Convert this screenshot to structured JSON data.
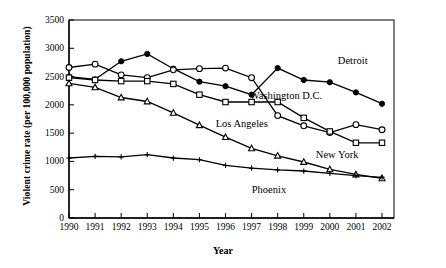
{
  "chart_data": {
    "type": "line",
    "title": "",
    "xlabel": "Year",
    "ylabel": "Violent crime rate (per 100,000 population)",
    "categories": [
      1990,
      1991,
      1992,
      1993,
      1994,
      1995,
      1996,
      1997,
      1998,
      1999,
      2000,
      2001,
      2002
    ],
    "x": [
      1990,
      1991,
      1992,
      1993,
      1994,
      1995,
      1996,
      1997,
      1998,
      1999,
      2000,
      2001,
      2002
    ],
    "xlim": [
      1990,
      2002
    ],
    "ylim": [
      0,
      3500
    ],
    "yticks": [
      0,
      500,
      1000,
      1500,
      2000,
      2500,
      3000,
      3500
    ],
    "ytick_labels": [
      "0",
      "500",
      "1000",
      "1500",
      "2000",
      "2500",
      "3000",
      "3500"
    ],
    "xtick_labels": [
      "1990",
      "1991",
      "1992",
      "1993",
      "1994",
      "1995",
      "1996",
      "1997",
      "1998",
      "1999",
      "2000",
      "2001",
      "2002"
    ],
    "grid": false,
    "legend_position": "inline-annotations",
    "series": [
      {
        "name": "Detroit",
        "marker": "filled-circle",
        "color": "#000000",
        "values": [
          2500,
          2450,
          2770,
          2900,
          2640,
          2410,
          2330,
          2180,
          2650,
          2440,
          2400,
          2220,
          2020
        ],
        "label_x": 2000,
        "label_y": 2770
      },
      {
        "name": "Washington D.C.",
        "marker": "open-circle",
        "color": "#000000",
        "values": [
          2660,
          2720,
          2530,
          2480,
          2620,
          2640,
          2650,
          2480,
          1810,
          1630,
          1510,
          1650,
          1560
        ],
        "label_x": 1999,
        "label_y": 2200
      },
      {
        "name": "Los Angeles",
        "marker": "open-square",
        "color": "#000000",
        "values": [
          2480,
          2440,
          2420,
          2420,
          2370,
          2180,
          2050,
          2050,
          2050,
          1770,
          1530,
          1330,
          1330
        ],
        "label_x": 1998,
        "label_y": 1700
      },
      {
        "name": "New York",
        "marker": "open-triangle",
        "color": "#000000",
        "values": [
          2380,
          2310,
          2130,
          2060,
          1860,
          1640,
          1430,
          1230,
          1100,
          990,
          860,
          770,
          700
        ],
        "label_x": 2000,
        "label_y": 1150
      },
      {
        "name": "Phoenix",
        "marker": "plus",
        "color": "#000000",
        "values": [
          1060,
          1090,
          1080,
          1120,
          1060,
          1030,
          930,
          880,
          850,
          830,
          790,
          750,
          720
        ],
        "label_x": 1999,
        "label_y": 700
      }
    ]
  },
  "axes": {
    "x_title": "Year",
    "y_title": "Violent crime rate (per 100,000 population)"
  }
}
